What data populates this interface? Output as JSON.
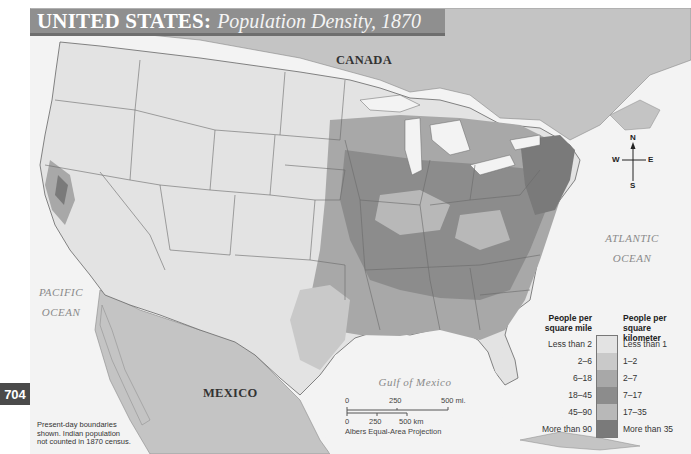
{
  "title": {
    "main": "UNITED STATES:",
    "subtitle": "Population Density, 1870"
  },
  "page_number": "704",
  "labels": {
    "canada": "CANADA",
    "mexico": "MEXICO",
    "pacific_ocean": [
      "PACIFIC",
      "OCEAN"
    ],
    "atlantic_ocean": [
      "ATLANTIC",
      "OCEAN"
    ],
    "gulf_of_mexico": "Gulf of Mexico"
  },
  "compass": {
    "n": "N",
    "s": "S",
    "e": "E",
    "w": "W"
  },
  "legend": {
    "left_heading": [
      "People per",
      "square mile"
    ],
    "right_heading": [
      "People per",
      "square kilometer"
    ],
    "rows": [
      {
        "per_mile": "Less than 2",
        "per_km": "Less than 1",
        "color": "#e3e3e3"
      },
      {
        "per_mile": "2–6",
        "per_km": "1–2",
        "color": "#c9c9c9"
      },
      {
        "per_mile": "6–18",
        "per_km": "2–7",
        "color": "#a8a8a8"
      },
      {
        "per_mile": "18–45",
        "per_km": "7–17",
        "color": "#8c8c8c"
      },
      {
        "per_mile": "45–90",
        "per_km": "17–35",
        "color": "#b8b8b8"
      },
      {
        "per_mile": "More than 90",
        "per_km": "More than 35",
        "color": "#7a7a7a"
      }
    ]
  },
  "scale_bar": {
    "miles": [
      "0",
      "250",
      "500 mi."
    ],
    "km": [
      "0",
      "250",
      "500 km"
    ],
    "projection": "Albers Equal-Area Projection"
  },
  "note": [
    "Present-day boundaries",
    "shown. Indian population",
    "not counted in 1870 census."
  ],
  "colors": {
    "water": "#f3f3f3",
    "foreign_land": "#c4c4c4",
    "title_bar": "#8f8f8f"
  }
}
